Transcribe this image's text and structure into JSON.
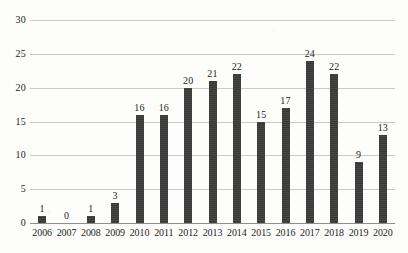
{
  "chart_data": {
    "type": "bar",
    "title": "",
    "subtitle": "",
    "xlabel": "",
    "ylabel": "",
    "categories": [
      "2006",
      "2007",
      "2008",
      "2009",
      "2010",
      "2011",
      "2012",
      "2013",
      "2014",
      "2015",
      "2016",
      "2017",
      "2018",
      "2019",
      "2020"
    ],
    "values": [
      1,
      0,
      1,
      3,
      16,
      16,
      20,
      21,
      22,
      15,
      17,
      24,
      22,
      9,
      13
    ],
    "data_labels": [
      "1",
      "0",
      "1",
      "3",
      "16",
      "16",
      "20",
      "21",
      "22",
      "15",
      "17",
      "24",
      "22",
      "9",
      "13"
    ],
    "ylim": [
      0,
      30
    ],
    "y_ticks": [
      0,
      5,
      10,
      15,
      20,
      25,
      30
    ],
    "y_tick_labels": [
      "0",
      "5",
      "10",
      "15",
      "20",
      "25",
      "30"
    ],
    "grid": true,
    "grid_axis": "y",
    "legend": false,
    "legend_position": "none",
    "series": [
      {
        "name": "",
        "values": [
          1,
          0,
          1,
          3,
          16,
          16,
          20,
          21,
          22,
          15,
          17,
          24,
          22,
          9,
          13
        ],
        "color": "#3b3b3b"
      }
    ]
  },
  "colors": {
    "background": "#fdfdfb",
    "bar": "#3b3b3b",
    "gridline": "#c9c9c6",
    "axis": "#8d8d8a",
    "text": "#1d1d1d"
  }
}
